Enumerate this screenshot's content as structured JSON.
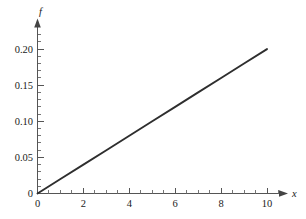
{
  "chart_data": {
    "type": "line",
    "title": "",
    "subtitle": "",
    "xlabel": "x",
    "ylabel": "f",
    "xlim": [
      0,
      10.8
    ],
    "ylim": [
      0,
      0.222
    ],
    "grid": false,
    "legend": null,
    "legend_position": "none",
    "series": [
      {
        "name": "f",
        "color": "#2e2e2e",
        "x": [
          0,
          1,
          2,
          3,
          4,
          5,
          6,
          7,
          8,
          9,
          10
        ],
        "values": [
          0,
          0.02,
          0.04,
          0.06,
          0.08,
          0.1,
          0.12,
          0.14,
          0.16,
          0.18,
          0.2
        ]
      }
    ],
    "x_major_ticks": [
      0,
      2,
      4,
      6,
      8,
      10
    ],
    "x_major_tick_labels": [
      "0",
      "2",
      "4",
      "6",
      "8",
      "10"
    ],
    "x_minor_ticks": [
      0.5,
      1,
      1.5,
      2.5,
      3,
      3.5,
      4.5,
      5,
      5.5,
      6.5,
      7,
      7.5,
      8.5,
      9,
      9.5,
      10.5
    ],
    "y_major_ticks": [
      0,
      0.05,
      0.1,
      0.15,
      0.2
    ],
    "y_major_tick_labels": [
      "0",
      "0.05",
      "0.10",
      "0.15",
      "0.20"
    ],
    "y_minor_ticks": [
      0.01,
      0.02,
      0.03,
      0.04,
      0.06,
      0.07,
      0.08,
      0.09,
      0.11,
      0.12,
      0.13,
      0.14,
      0.16,
      0.17,
      0.18,
      0.19,
      0.21
    ],
    "axis_color": "#555555",
    "background": "#ffffff",
    "axis_style": "arrow-terminated"
  },
  "labels": {
    "y_axis_name": "f",
    "x_axis_name": "x",
    "y_tick_0": "0",
    "y_tick_1": "0.05",
    "y_tick_2": "0.10",
    "y_tick_3": "0.15",
    "y_tick_4": "0.20",
    "x_tick_0": "0",
    "x_tick_1": "2",
    "x_tick_2": "4",
    "x_tick_3": "6",
    "x_tick_4": "8",
    "x_tick_5": "10"
  }
}
